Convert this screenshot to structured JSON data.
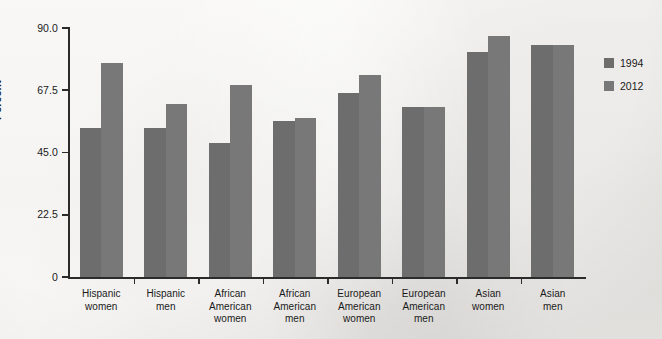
{
  "chart_data": {
    "type": "bar",
    "title": "",
    "xlabel": "",
    "ylabel": "Percent",
    "ylim": [
      0,
      90
    ],
    "yticks": [
      0,
      22.5,
      45.0,
      67.5,
      90.0
    ],
    "ytick_labels": [
      "0",
      "22.5",
      "45.0",
      "67.5",
      "90.0"
    ],
    "grid": false,
    "legend_position": "right",
    "categories": [
      "Hispanic\nwomen",
      "Hispanic\nmen",
      "African\nAmerican\nwomen",
      "African\nAmerican\nmen",
      "European\nAmerican\nwomen",
      "European\nAmerican\nmen",
      "Asian\nwomen",
      "Asian\nmen"
    ],
    "series": [
      {
        "name": "1994",
        "color": "#6d6d6d",
        "values": [
          54.0,
          54.0,
          48.5,
          56.5,
          66.5,
          61.5,
          81.5,
          84.0
        ]
      },
      {
        "name": "2012",
        "color": "#787878",
        "values": [
          77.5,
          62.5,
          69.5,
          57.5,
          73.0,
          61.5,
          87.0,
          84.0
        ]
      }
    ]
  },
  "legend": {
    "entries": [
      {
        "label": "1994",
        "color": "#6d6d6d"
      },
      {
        "label": "2012",
        "color": "#787878"
      }
    ]
  },
  "colors": {
    "background": "#eceae6",
    "axis": "#2b2b2b",
    "series_1994": "#6d6d6d",
    "series_2012": "#787878"
  }
}
